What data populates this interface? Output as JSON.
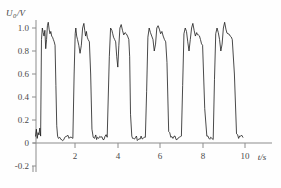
{
  "chart_data": {
    "type": "line",
    "title": "",
    "xlabel": "t/s",
    "ylabel": "U_0/V",
    "ylabel_main": "U",
    "ylabel_sub": "0",
    "ylabel_unit": "/V",
    "xlim": [
      0,
      10.6
    ],
    "ylim": [
      -0.25,
      1.12
    ],
    "grid": false,
    "legend": false,
    "series_name": "output voltage",
    "line_color": "#1c1c1c",
    "axis_color": "#8c8c8c",
    "xticks": [
      2,
      4,
      6,
      8,
      10
    ],
    "xtick_labels": [
      "2",
      "4",
      "6",
      "8",
      "10"
    ],
    "yticks": [
      -0.2,
      0,
      0.2,
      0.4,
      0.6,
      0.8,
      1.0
    ],
    "ytick_labels": [
      "-0.2",
      "0",
      "0.2",
      "0.4",
      "0.6",
      "0.8",
      "1.0"
    ],
    "high_level": 1.0,
    "low_level": 0.03,
    "pulse_count": 6,
    "x": [
      0.12,
      0.16,
      0.2,
      0.24,
      0.28,
      0.32,
      0.36,
      0.4,
      0.44,
      0.48,
      0.52,
      0.56,
      0.6,
      0.64,
      0.68,
      0.72,
      0.76,
      0.8,
      0.84,
      0.88,
      0.92,
      0.96,
      1.0,
      1.04,
      1.08,
      1.12,
      1.16,
      1.2,
      1.26,
      1.32,
      1.4,
      1.5,
      1.6,
      1.7,
      1.8,
      1.88,
      1.94,
      1.99,
      2.02,
      2.06,
      2.1,
      2.16,
      2.22,
      2.28,
      2.34,
      2.4,
      2.44,
      2.48,
      2.52,
      2.56,
      2.6,
      2.66,
      2.72,
      2.78,
      2.84,
      2.9,
      2.96,
      3.0,
      3.04,
      3.1,
      3.2,
      3.3,
      3.4,
      3.5,
      3.6,
      3.66,
      3.72,
      3.76,
      3.8,
      3.85,
      3.9,
      3.95,
      4.0,
      4.05,
      4.1,
      4.16,
      4.22,
      4.28,
      4.34,
      4.4,
      4.46,
      4.52,
      4.56,
      4.6,
      4.66,
      4.74,
      4.84,
      4.96,
      5.1,
      5.2,
      5.3,
      5.36,
      5.42,
      5.48,
      5.54,
      5.6,
      5.66,
      5.72,
      5.78,
      5.84,
      5.9,
      5.96,
      6.02,
      6.08,
      6.14,
      6.2,
      6.26,
      6.32,
      6.4,
      6.5,
      6.6,
      6.7,
      6.8,
      6.9,
      7.0,
      7.06,
      7.12,
      7.18,
      7.24,
      7.3,
      7.36,
      7.42,
      7.48,
      7.54,
      7.6,
      7.66,
      7.72,
      7.8,
      7.9,
      8.0,
      8.1,
      8.2,
      8.3,
      8.38,
      8.44,
      8.5,
      8.56,
      8.62,
      8.68,
      8.74,
      8.8,
      8.86,
      8.92,
      8.98,
      9.04,
      9.1,
      9.2,
      9.3,
      9.4,
      9.5,
      9.6,
      9.7,
      9.8,
      9.9
    ],
    "y": [
      0.06,
      0.12,
      0.04,
      0.09,
      0.07,
      0.13,
      0.06,
      0.9,
      1.0,
      0.96,
      0.93,
      0.98,
      0.82,
      0.9,
      1.02,
      1.05,
      0.99,
      0.95,
      0.97,
      0.93,
      0.92,
      0.9,
      0.88,
      0.85,
      0.5,
      0.15,
      0.06,
      0.04,
      0.05,
      0.03,
      0.02,
      0.05,
      0.06,
      0.04,
      0.05,
      0.04,
      0.6,
      0.95,
      1.0,
      0.93,
      0.9,
      0.85,
      0.78,
      0.85,
      1.0,
      1.04,
      0.98,
      0.93,
      0.97,
      0.92,
      0.9,
      0.88,
      0.6,
      0.12,
      0.05,
      0.04,
      0.07,
      0.03,
      0.05,
      0.04,
      0.05,
      0.03,
      0.06,
      0.05,
      0.75,
      1.0,
      0.98,
      0.95,
      0.92,
      0.9,
      0.88,
      0.75,
      0.66,
      0.85,
      1.0,
      1.03,
      0.98,
      0.94,
      0.96,
      0.95,
      0.93,
      0.9,
      0.75,
      0.25,
      0.06,
      0.04,
      0.05,
      0.03,
      0.06,
      0.04,
      0.05,
      0.45,
      0.92,
      1.0,
      0.96,
      0.93,
      0.9,
      0.8,
      0.86,
      1.0,
      1.02,
      0.99,
      0.95,
      0.97,
      0.93,
      0.9,
      0.88,
      0.7,
      0.1,
      0.05,
      0.04,
      0.06,
      0.03,
      0.05,
      0.06,
      0.5,
      0.95,
      1.0,
      0.97,
      0.88,
      0.8,
      0.9,
      1.0,
      1.04,
      0.98,
      0.93,
      0.96,
      0.94,
      0.9,
      0.85,
      0.3,
      0.06,
      0.04,
      0.05,
      0.04,
      0.03,
      0.55,
      0.95,
      1.0,
      0.96,
      0.9,
      0.8,
      0.86,
      1.0,
      1.05,
      0.99,
      0.95,
      0.93,
      0.9,
      0.6,
      0.08,
      0.04,
      0.06,
      0.05
    ]
  }
}
